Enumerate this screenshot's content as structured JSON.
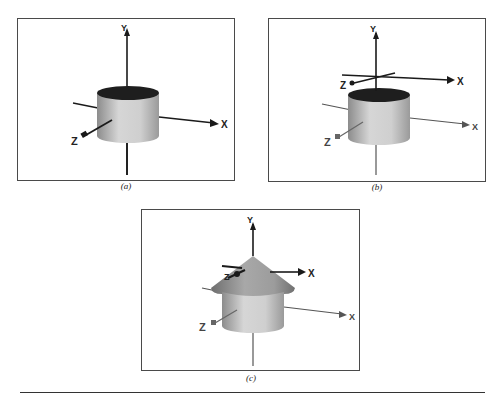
{
  "figure": {
    "panels": [
      {
        "id": "a",
        "caption": "(a)",
        "description": "Cylinder with world axes",
        "axes": {
          "x": "X",
          "y": "Y",
          "z": "Z"
        }
      },
      {
        "id": "b",
        "caption": "(b)",
        "description": "Cylinder with world axes and a translated local coordinate frame above it",
        "axes": {
          "x": "X",
          "y": "Y",
          "z": "Z"
        },
        "local_axes": {
          "x": "X",
          "y": "Y",
          "z": "Z"
        }
      },
      {
        "id": "c",
        "caption": "(c)",
        "description": "Cone placed on top of cylinder at local frame",
        "axes": {
          "x": "X",
          "y": "Y",
          "z": "Z"
        },
        "local_axes": {
          "x": "X",
          "y": "Y",
          "z": "Z"
        }
      }
    ],
    "colors": {
      "frame": "#4a4a4a",
      "axis": "#1a1a1a",
      "cylinder_top": "#1e1e1e",
      "cylinder_body": "#c8c8c8",
      "cone": "#9a9a9a",
      "rule": "#333333"
    }
  }
}
